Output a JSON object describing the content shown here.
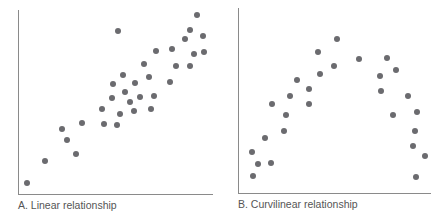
{
  "chart_data": [
    {
      "type": "scatter",
      "title": "A. Linear relationship",
      "xlabel": "",
      "ylabel": "",
      "grid": false,
      "axes_ticks": false,
      "pixel_frame": {
        "x0": 18,
        "y0": 194,
        "x1": 213,
        "y1": 10
      },
      "points": [
        [
          27,
          183
        ],
        [
          45,
          161
        ],
        [
          62,
          129
        ],
        [
          67,
          140
        ],
        [
          76,
          154
        ],
        [
          82,
          123
        ],
        [
          102,
          109
        ],
        [
          104,
          124
        ],
        [
          117,
          125
        ],
        [
          118,
          31
        ],
        [
          112,
          98
        ],
        [
          113,
          84
        ],
        [
          123,
          75
        ],
        [
          125,
          92
        ],
        [
          130,
          102
        ],
        [
          120,
          114
        ],
        [
          134,
          111
        ],
        [
          135,
          83
        ],
        [
          140,
          97
        ],
        [
          144,
          64
        ],
        [
          149,
          77
        ],
        [
          151,
          109
        ],
        [
          154,
          96
        ],
        [
          156,
          51
        ],
        [
          170,
          82
        ],
        [
          172,
          49
        ],
        [
          176,
          66
        ],
        [
          185,
          39
        ],
        [
          190,
          30
        ],
        [
          190,
          66
        ],
        [
          194,
          54
        ],
        [
          197,
          15
        ],
        [
          203,
          36
        ],
        [
          204,
          52
        ]
      ]
    },
    {
      "type": "scatter",
      "title": "B. Curvilinear relationship",
      "xlabel": "",
      "ylabel": "",
      "grid": false,
      "axes_ticks": false,
      "pixel_frame": {
        "x0": 238,
        "y0": 193,
        "x1": 431,
        "y1": 8
      },
      "points": [
        [
          252,
          152
        ],
        [
          258,
          164
        ],
        [
          253,
          176
        ],
        [
          265,
          138
        ],
        [
          271,
          163
        ],
        [
          272,
          104
        ],
        [
          284,
          131
        ],
        [
          286,
          115
        ],
        [
          290,
          96
        ],
        [
          297,
          80
        ],
        [
          309,
          89
        ],
        [
          309,
          104
        ],
        [
          318,
          52
        ],
        [
          320,
          74
        ],
        [
          334,
          66
        ],
        [
          337,
          39
        ],
        [
          359,
          59
        ],
        [
          380,
          76
        ],
        [
          381,
          91
        ],
        [
          387,
          58
        ],
        [
          393,
          115
        ],
        [
          396,
          70
        ],
        [
          408,
          96
        ],
        [
          417,
          112
        ],
        [
          415,
          131
        ],
        [
          413,
          146
        ],
        [
          425,
          156
        ],
        [
          416,
          177
        ]
      ]
    }
  ],
  "panels": {
    "a": {
      "caption": "A. Linear relationship"
    },
    "b": {
      "caption": "B. Curvilinear relationship"
    }
  },
  "colors": {
    "dot": "#6b6b6f",
    "axis": "#8a8a8a",
    "caption": "#555555"
  }
}
